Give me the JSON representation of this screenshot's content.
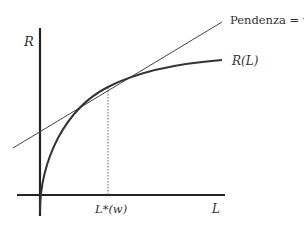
{
  "diagram": {
    "y_axis_label": "R",
    "x_axis_label": "L",
    "curve_label": "R(L)",
    "tangent_label": "Pendenza = w",
    "tangent_point_label": "L*(w)"
  },
  "colors": {
    "axis": "#222222",
    "curve": "#333333",
    "tangent": "#444444",
    "dotted": "#666666"
  }
}
